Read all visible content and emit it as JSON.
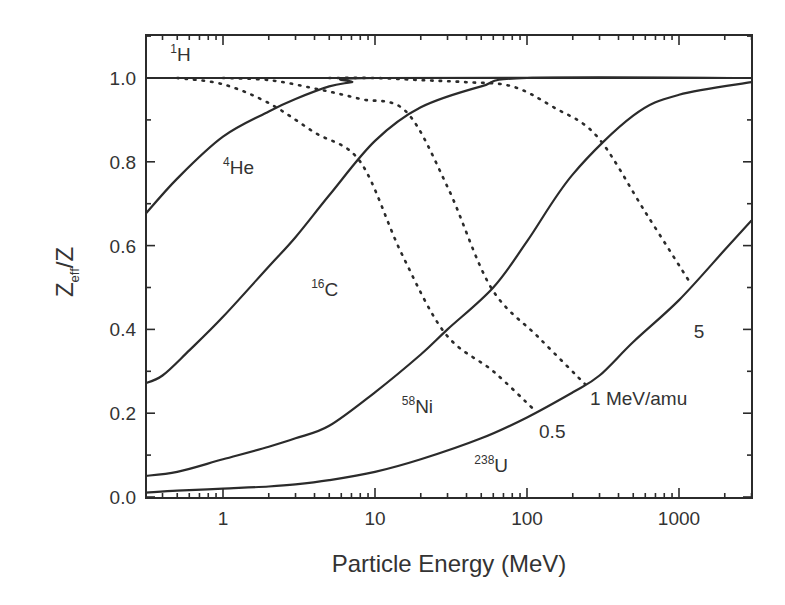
{
  "chart_data": {
    "type": "line",
    "title": "",
    "xlabel": "Particle Energy (MeV)",
    "ylabel_main": "Z",
    "ylabel_sub": "eff",
    "ylabel_tail": "/Z",
    "xscale": "log",
    "xlim": [
      0.3,
      3000
    ],
    "ylim": [
      0.0,
      1.1
    ],
    "xticks": [
      1,
      10,
      100,
      1000
    ],
    "xtick_labels": [
      "1",
      "10",
      "100",
      "1000"
    ],
    "yticks": [
      0.0,
      0.2,
      0.4,
      0.6,
      0.8,
      1.0
    ],
    "ytick_labels": [
      "0.0",
      "0.2",
      "0.4",
      "0.6",
      "0.8",
      "1.0"
    ],
    "grid": false,
    "legend": "none (inline annotations)",
    "series": [
      {
        "name": "1H",
        "mass": "1",
        "symbol": "H",
        "style": "solid",
        "x": [
          0.3,
          1,
          10,
          100,
          1000,
          3000
        ],
        "y": [
          1.0,
          1.0,
          1.0,
          1.0,
          1.0,
          1.0
        ]
      },
      {
        "name": "4He",
        "mass": "4",
        "symbol": "He",
        "style": "solid",
        "x": [
          0.3,
          0.5,
          1,
          2,
          3,
          5,
          7,
          10,
          3000
        ],
        "y": [
          0.67,
          0.76,
          0.86,
          0.92,
          0.95,
          0.98,
          0.99,
          1.0,
          1.0
        ]
      },
      {
        "name": "16C",
        "mass": "16",
        "symbol": "C",
        "style": "solid",
        "x": [
          0.3,
          0.4,
          0.6,
          1,
          2,
          3,
          5,
          10,
          20,
          50,
          100,
          3000
        ],
        "y": [
          0.27,
          0.29,
          0.35,
          0.43,
          0.55,
          0.62,
          0.72,
          0.85,
          0.93,
          0.98,
          1.0,
          1.0
        ]
      },
      {
        "name": "58Ni",
        "mass": "58",
        "symbol": "Ni",
        "style": "solid",
        "x": [
          0.3,
          0.5,
          1,
          2,
          3,
          5,
          10,
          20,
          30,
          60,
          100,
          200,
          500,
          1000,
          3000
        ],
        "y": [
          0.05,
          0.06,
          0.09,
          0.12,
          0.14,
          0.17,
          0.25,
          0.34,
          0.4,
          0.5,
          0.61,
          0.77,
          0.91,
          0.96,
          0.99
        ]
      },
      {
        "name": "238U",
        "mass": "238",
        "symbol": "U",
        "style": "solid",
        "x": [
          0.3,
          0.5,
          1,
          2,
          3,
          5,
          10,
          20,
          50,
          100,
          200,
          300,
          500,
          1000,
          2000,
          3000
        ],
        "y": [
          0.01,
          0.015,
          0.02,
          0.025,
          0.03,
          0.04,
          0.06,
          0.09,
          0.14,
          0.19,
          0.25,
          0.29,
          0.37,
          0.47,
          0.59,
          0.66
        ]
      }
    ],
    "iso_velocity_lines": [
      {
        "label": "0.5",
        "style": "dotted",
        "x": [
          0.5,
          1,
          2,
          4,
          8,
          15,
          29,
          60,
          110
        ],
        "y": [
          1.0,
          0.985,
          0.94,
          0.87,
          0.8,
          0.58,
          0.39,
          0.3,
          0.21
        ]
      },
      {
        "label": "1 MeV/amu",
        "style": "dotted",
        "x": [
          1,
          2,
          4,
          8,
          16,
          30,
          58,
          120,
          240
        ],
        "y": [
          1.0,
          0.995,
          0.975,
          0.95,
          0.92,
          0.74,
          0.5,
          0.38,
          0.27
        ]
      },
      {
        "label": "5",
        "style": "dotted",
        "x": [
          5,
          10,
          20,
          40,
          80,
          150,
          290,
          600,
          1190
        ],
        "y": [
          1.0,
          1.0,
          0.995,
          0.99,
          0.98,
          0.93,
          0.86,
          0.68,
          0.51
        ]
      }
    ],
    "annotations": [
      {
        "text": "1H",
        "mass": "1",
        "symbol": "H",
        "x": 0.45,
        "y": 1.04
      },
      {
        "text": "4He",
        "mass": "4",
        "symbol": "He",
        "x": 1.0,
        "y": 0.77
      },
      {
        "text": "16C",
        "mass": "16",
        "symbol": "C",
        "x": 3.8,
        "y": 0.48
      },
      {
        "text": "58Ni",
        "mass": "58",
        "symbol": "Ni",
        "x": 15,
        "y": 0.2
      },
      {
        "text": "238U",
        "mass": "238",
        "symbol": "U",
        "x": 45,
        "y": 0.06
      },
      {
        "text": "0.5",
        "x": 120,
        "y": 0.14
      },
      {
        "text": "1 MeV/amu",
        "x": 260,
        "y": 0.22
      },
      {
        "text": "5",
        "x": 1250,
        "y": 0.38
      }
    ]
  }
}
